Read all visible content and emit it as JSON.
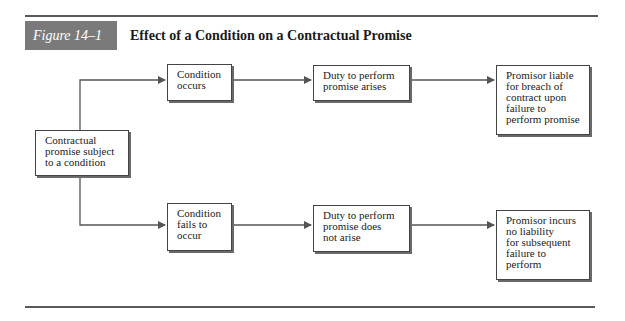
{
  "figure": {
    "label": "Figure 14–1",
    "title": "Effect of a Condition on a Contractual Promise"
  },
  "nodes": {
    "start": "Contractual\npromise subject\nto a condition",
    "condition_occurs": "Condition\noccurs",
    "duty_arises": "Duty to perform\npromise arises",
    "promisor_liable": "Promisor liable\nfor breach of\ncontract upon\nfailure to\nperform promise",
    "condition_fails": "Condition\nfails to\noccur",
    "duty_not_arise": "Duty to perform\npromise does\nnot arise",
    "no_liability": "Promisor incurs\nno liability\nfor subsequent\nfailure to\nperform"
  },
  "edges": [
    {
      "from": "start",
      "to": "condition_occurs"
    },
    {
      "from": "condition_occurs",
      "to": "duty_arises"
    },
    {
      "from": "duty_arises",
      "to": "promisor_liable"
    },
    {
      "from": "start",
      "to": "condition_fails"
    },
    {
      "from": "condition_fails",
      "to": "duty_not_arise"
    },
    {
      "from": "duty_not_arise",
      "to": "no_liability"
    }
  ],
  "colors": {
    "label_bg": "#7a7a7a",
    "rule": "#5a5a5a",
    "line": "#555555"
  }
}
